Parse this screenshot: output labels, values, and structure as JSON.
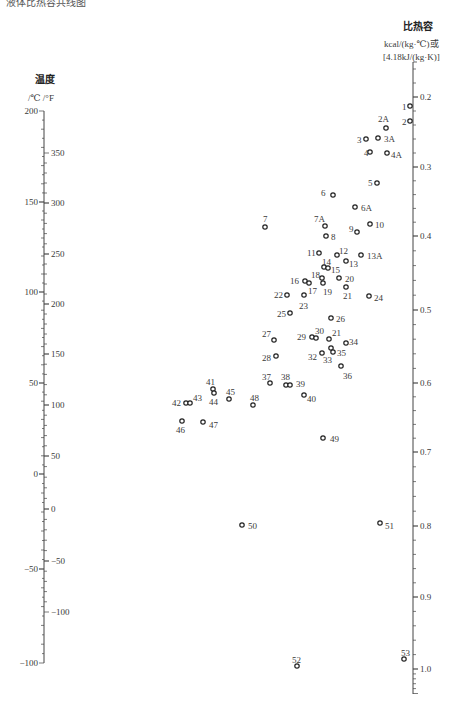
{
  "header": {
    "clipped_text": "液体比热容共线图"
  },
  "left_axis": {
    "title": "温度",
    "units": "/℃  /°F",
    "celsius_ticks": [
      {
        "label": "200",
        "y": 111
      },
      {
        "label": "150",
        "y": 202
      },
      {
        "label": "100",
        "y": 292
      },
      {
        "label": "50",
        "y": 383
      },
      {
        "label": "0",
        "y": 474
      },
      {
        "label": "−50",
        "y": 569
      },
      {
        "label": "−100",
        "y": 663
      }
    ],
    "fahrenheit_ticks": [
      {
        "label": "350",
        "y": 153
      },
      {
        "label": "300",
        "y": 203
      },
      {
        "label": "250",
        "y": 254
      },
      {
        "label": "200",
        "y": 304
      },
      {
        "label": "150",
        "y": 354
      },
      {
        "label": "100",
        "y": 405
      },
      {
        "label": "50",
        "y": 456
      },
      {
        "label": "0",
        "y": 509
      },
      {
        "label": "−50",
        "y": 561
      },
      {
        "label": "−100",
        "y": 612
      }
    ]
  },
  "right_axis": {
    "title": "比热容",
    "unit_line1": "kcal/(kg·℃)或",
    "unit_line2": "[4.18kJ/(kg·K)]",
    "ticks": [
      {
        "label": "0.2",
        "y": 97
      },
      {
        "label": "0.3",
        "y": 167
      },
      {
        "label": "0.4",
        "y": 236
      },
      {
        "label": "0.5",
        "y": 310
      },
      {
        "label": "0.6",
        "y": 383
      },
      {
        "label": "0.7",
        "y": 452
      },
      {
        "label": "0.8",
        "y": 526
      },
      {
        "label": "0.9",
        "y": 597
      },
      {
        "label": "1.0",
        "y": 669
      }
    ]
  },
  "points": [
    {
      "id": "1",
      "x": 410,
      "y": 106,
      "lx": 402,
      "ly": 102
    },
    {
      "id": "2",
      "x": 410,
      "y": 121,
      "lx": 402,
      "ly": 117
    },
    {
      "id": "2A",
      "x": 386,
      "y": 128,
      "lx": 378,
      "ly": 114
    },
    {
      "id": "3",
      "x": 366,
      "y": 139,
      "lx": 357,
      "ly": 135
    },
    {
      "id": "3A",
      "x": 378,
      "y": 138,
      "lx": 384,
      "ly": 134
    },
    {
      "id": "4",
      "x": 370,
      "y": 152,
      "lx": 364,
      "ly": 148
    },
    {
      "id": "4A",
      "x": 387,
      "y": 153,
      "lx": 391,
      "ly": 150
    },
    {
      "id": "5",
      "x": 377,
      "y": 183,
      "lx": 368,
      "ly": 178
    },
    {
      "id": "6",
      "x": 333,
      "y": 195,
      "lx": 321,
      "ly": 188
    },
    {
      "id": "6A",
      "x": 355,
      "y": 207,
      "lx": 361,
      "ly": 203
    },
    {
      "id": "7",
      "x": 265,
      "y": 227,
      "lx": 263,
      "ly": 214
    },
    {
      "id": "7A",
      "x": 325,
      "y": 226,
      "lx": 314,
      "ly": 214
    },
    {
      "id": "8",
      "x": 326,
      "y": 236,
      "lx": 331,
      "ly": 232
    },
    {
      "id": "9",
      "x": 357,
      "y": 232,
      "lx": 349,
      "ly": 224
    },
    {
      "id": "10",
      "x": 370,
      "y": 224,
      "lx": 375,
      "ly": 220
    },
    {
      "id": "11",
      "x": 319,
      "y": 253,
      "lx": 307,
      "ly": 248
    },
    {
      "id": "12",
      "x": 337,
      "y": 255,
      "lx": 339,
      "ly": 246
    },
    {
      "id": "13",
      "x": 346,
      "y": 261,
      "lx": 349,
      "ly": 259
    },
    {
      "id": "13A",
      "x": 361,
      "y": 255,
      "lx": 367,
      "ly": 251
    },
    {
      "id": "14",
      "x": 324,
      "y": 267,
      "lx": 322,
      "ly": 257
    },
    {
      "id": "15",
      "x": 328,
      "y": 268,
      "lx": 331,
      "ly": 265
    },
    {
      "id": "16",
      "x": 305,
      "y": 281,
      "lx": 290,
      "ly": 276
    },
    {
      "id": "17",
      "x": 309,
      "y": 283,
      "lx": 308,
      "ly": 286
    },
    {
      "id": "18",
      "x": 322,
      "y": 278,
      "lx": 311,
      "ly": 270
    },
    {
      "id": "19",
      "x": 323,
      "y": 283,
      "lx": 323,
      "ly": 287
    },
    {
      "id": "20",
      "x": 339,
      "y": 278,
      "lx": 345,
      "ly": 274
    },
    {
      "id": "21",
      "x": 346,
      "y": 287,
      "lx": 343,
      "ly": 291
    },
    {
      "id": "22",
      "x": 287,
      "y": 295,
      "lx": 274,
      "ly": 290
    },
    {
      "id": "23",
      "x": 304,
      "y": 295,
      "lx": 299,
      "ly": 301
    },
    {
      "id": "24",
      "x": 369,
      "y": 296,
      "lx": 374,
      "ly": 293
    },
    {
      "id": "25",
      "x": 290,
      "y": 313,
      "lx": 277,
      "ly": 309
    },
    {
      "id": "26",
      "x": 331,
      "y": 318,
      "lx": 336,
      "ly": 314
    },
    {
      "id": "27",
      "x": 274,
      "y": 340,
      "lx": 262,
      "ly": 329
    },
    {
      "id": "28",
      "x": 276,
      "y": 356,
      "lx": 262,
      "ly": 353
    },
    {
      "id": "29",
      "x": 312,
      "y": 337,
      "lx": 297,
      "ly": 332
    },
    {
      "id": "30",
      "x": 316,
      "y": 338,
      "lx": 315,
      "ly": 326
    },
    {
      "id": "21",
      "x": 329,
      "y": 339,
      "lx": 332,
      "ly": 328
    },
    {
      "id": "34",
      "x": 346,
      "y": 343,
      "lx": 349,
      "ly": 337
    },
    {
      "id": "32",
      "x": 322,
      "y": 353,
      "lx": 308,
      "ly": 352
    },
    {
      "id": "33",
      "x": 331,
      "y": 348,
      "lx": 323,
      "ly": 355
    },
    {
      "id": "35",
      "x": 333,
      "y": 352,
      "lx": 337,
      "ly": 348
    },
    {
      "id": "36",
      "x": 341,
      "y": 366,
      "lx": 343,
      "ly": 371
    },
    {
      "id": "37",
      "x": 270,
      "y": 383,
      "lx": 262,
      "ly": 372
    },
    {
      "id": "38",
      "x": 286,
      "y": 385,
      "lx": 281,
      "ly": 372
    },
    {
      "id": "39",
      "x": 290,
      "y": 385,
      "lx": 296,
      "ly": 379
    },
    {
      "id": "40",
      "x": 304,
      "y": 395,
      "lx": 307,
      "ly": 394
    },
    {
      "id": "41",
      "x": 213,
      "y": 389,
      "lx": 206,
      "ly": 377
    },
    {
      "id": "42",
      "x": 186,
      "y": 403,
      "lx": 172,
      "ly": 398
    },
    {
      "id": "43",
      "x": 190,
      "y": 403,
      "lx": 193,
      "ly": 393
    },
    {
      "id": "44",
      "x": 214,
      "y": 393,
      "lx": 209,
      "ly": 397
    },
    {
      "id": "45",
      "x": 229,
      "y": 399,
      "lx": 226,
      "ly": 387
    },
    {
      "id": "46",
      "x": 182,
      "y": 421,
      "lx": 176,
      "ly": 425
    },
    {
      "id": "47",
      "x": 203,
      "y": 422,
      "lx": 209,
      "ly": 420
    },
    {
      "id": "48",
      "x": 253,
      "y": 405,
      "lx": 250,
      "ly": 393
    },
    {
      "id": "49",
      "x": 323,
      "y": 438,
      "lx": 330,
      "ly": 434
    },
    {
      "id": "50",
      "x": 242,
      "y": 525,
      "lx": 248,
      "ly": 521
    },
    {
      "id": "51",
      "x": 380,
      "y": 523,
      "lx": 385,
      "ly": 521
    },
    {
      "id": "52",
      "x": 297,
      "y": 666,
      "lx": 292,
      "ly": 655
    },
    {
      "id": "53",
      "x": 404,
      "y": 659,
      "lx": 401,
      "ly": 648
    }
  ]
}
